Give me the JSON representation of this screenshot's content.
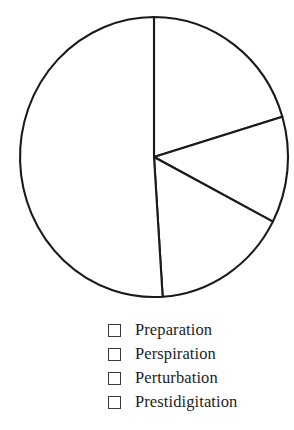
{
  "chart_data": {
    "type": "pie",
    "title": "",
    "subtitle": "",
    "xlabel": "",
    "ylabel": "",
    "legend_position": "bottom-center",
    "grid": false,
    "start_angle_deg": 0,
    "direction": "clockwise",
    "center": {
      "x": 154,
      "y": 157
    },
    "radius": {
      "rx": 134,
      "ry": 140
    },
    "categories": [
      "Preparation",
      "Perspiration",
      "Perturbation",
      "Prestidigitation"
    ],
    "values": [
      20.4,
      12.3,
      16.3,
      51.0
    ],
    "unit": "%",
    "slices": [
      {
        "label": "Preparation",
        "value": 20.4,
        "start_angle_deg": 0.0,
        "end_angle_deg": 73.3,
        "sweep_deg": 73.3,
        "fill": "#ffffff",
        "stroke": "#1a1a1a"
      },
      {
        "label": "Perspiration",
        "value": 12.3,
        "start_angle_deg": 73.3,
        "end_angle_deg": 117.5,
        "sweep_deg": 44.2,
        "fill": "#ffffff",
        "stroke": "#1a1a1a"
      },
      {
        "label": "Perturbation",
        "value": 16.3,
        "start_angle_deg": 117.5,
        "end_angle_deg": 176.3,
        "sweep_deg": 58.8,
        "fill": "#ffffff",
        "stroke": "#1a1a1a"
      },
      {
        "label": "Prestidigitation",
        "value": 51.0,
        "start_angle_deg": 176.3,
        "end_angle_deg": 360.0,
        "sweep_deg": 183.7,
        "fill": "#ffffff",
        "stroke": "#1a1a1a"
      }
    ]
  },
  "legend": {
    "items": [
      {
        "label": "Preparation",
        "swatch_fill": "#ffffff",
        "swatch_border": "#3a3a3a"
      },
      {
        "label": "Perspiration",
        "swatch_fill": "#ffffff",
        "swatch_border": "#3a3a3a"
      },
      {
        "label": "Perturbation",
        "swatch_fill": "#ffffff",
        "swatch_border": "#3a3a3a"
      },
      {
        "label": "Prestidigitation",
        "swatch_fill": "#ffffff",
        "swatch_border": "#3a3a3a"
      }
    ]
  },
  "colors": {
    "background": "#ffffff",
    "outline": "#1a1a1a",
    "text": "#1d1d1d",
    "swatch_border": "#3a3a3a"
  }
}
